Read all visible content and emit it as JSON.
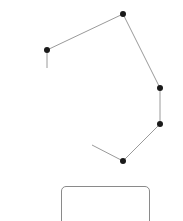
{
  "diagram": {
    "line_color": "#9a9a9a",
    "node_color": "#1a1a1a",
    "node_radius": 3,
    "polyline": [
      {
        "x": 47,
        "y": 68
      },
      {
        "x": 47,
        "y": 50
      },
      {
        "x": 123,
        "y": 14
      },
      {
        "x": 160,
        "y": 88
      },
      {
        "x": 160,
        "y": 124
      },
      {
        "x": 123,
        "y": 161
      },
      {
        "x": 92,
        "y": 145
      }
    ],
    "nodes": [
      {
        "x": 47,
        "y": 50
      },
      {
        "x": 123,
        "y": 14
      },
      {
        "x": 160,
        "y": 88
      },
      {
        "x": 160,
        "y": 124
      },
      {
        "x": 123,
        "y": 161
      }
    ]
  },
  "box": {
    "border_color": "#8a8a8a"
  }
}
